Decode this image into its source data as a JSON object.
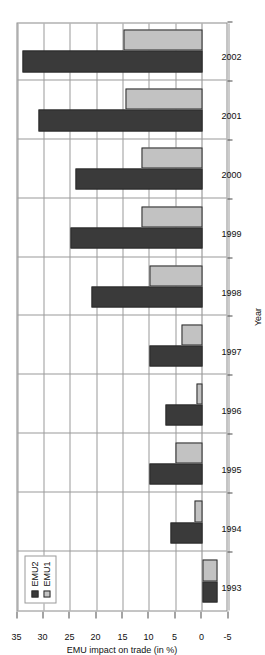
{
  "chart_data": {
    "type": "bar",
    "orientation": "horizontal-rotated",
    "title": "",
    "xlabel": "Year",
    "ylabel": "EMU impact on trade (in %)",
    "categories": [
      "1993",
      "1994",
      "1995",
      "1996",
      "1997",
      "1998",
      "1999",
      "2000",
      "2001",
      "2002"
    ],
    "ylim": [
      -5,
      35
    ],
    "yticks": [
      -5,
      0,
      5,
      10,
      15,
      20,
      25,
      30,
      35
    ],
    "ytick_labels": [
      "-5",
      "0",
      "5",
      "10",
      "15",
      "20",
      "25",
      "30",
      "35"
    ],
    "grid": true,
    "legend_position": "upper-left",
    "series": [
      {
        "name": "EMU2",
        "color": "#3a3a3a",
        "values": [
          -3,
          6,
          10,
          7,
          10,
          21,
          25,
          24,
          31,
          34
        ]
      },
      {
        "name": "EMU1",
        "color": "#c2c2c2",
        "values": [
          -3,
          1.5,
          5,
          1,
          4,
          10,
          11.5,
          11.5,
          14.5,
          15
        ]
      }
    ]
  },
  "legend": {
    "items": [
      {
        "label": "EMU2"
      },
      {
        "label": "EMU1"
      }
    ]
  },
  "axes": {
    "value_axis_title": "EMU impact on trade (in %)",
    "category_axis_title": "Year"
  }
}
